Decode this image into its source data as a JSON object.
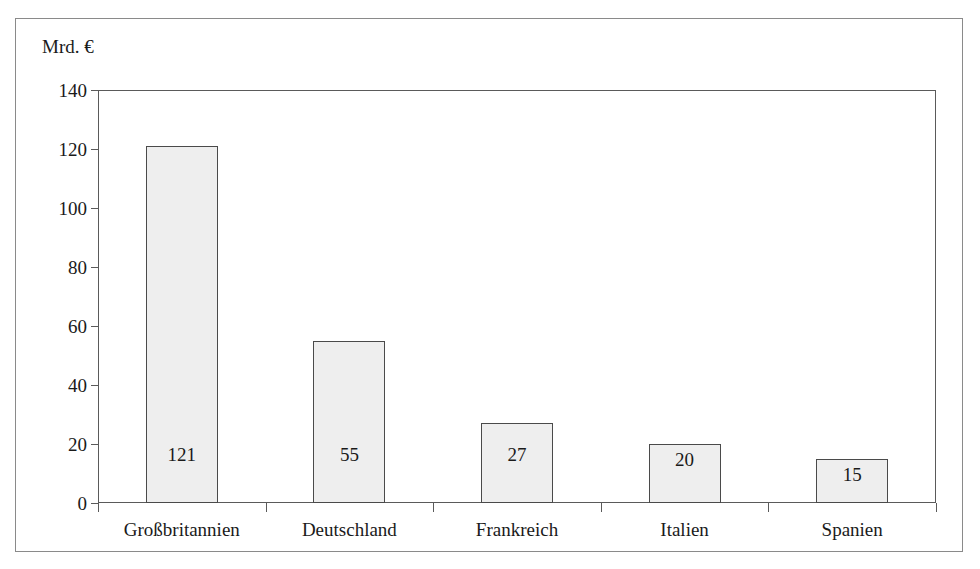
{
  "chart_data": {
    "type": "bar",
    "title": "",
    "subtitle": "",
    "xlabel": "",
    "ylabel": "Mrd. €",
    "unit_label": "Mrd. €",
    "categories": [
      "Großbritannien",
      "Deutschland",
      "Frankreich",
      "Italien",
      "Spanien"
    ],
    "values": [
      121,
      55,
      27,
      20,
      15
    ],
    "data_labels": [
      "121",
      "55",
      "27",
      "20",
      "15"
    ],
    "ylim": [
      0,
      140
    ],
    "ytick_step": 20,
    "yticks": [
      0,
      20,
      40,
      60,
      80,
      100,
      120,
      140
    ],
    "ytick_labels": [
      "0",
      "20",
      "40",
      "60",
      "80",
      "100",
      "120",
      "140"
    ],
    "grid": false,
    "legend": null,
    "legend_position": "none",
    "annotations": []
  },
  "style": {
    "bar_fill": "#eeeeee",
    "bar_stroke": "#4a4a4a",
    "axis_color": "#5a5a5a",
    "frame_color": "#8a8a8a",
    "text_color": "#1a1a1a",
    "background": "#ffffff"
  }
}
